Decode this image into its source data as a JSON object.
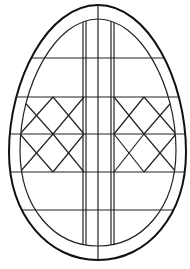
{
  "colors": {
    "background": "#ffffff",
    "line": "#222222"
  },
  "elements": {
    "outer_outline": "egg-outline",
    "inner_outline": "egg-inner-outline",
    "vertical_bands": [
      "left-double-stripe",
      "center-line",
      "right-double-stripe"
    ],
    "horizontal_bands": [
      "upper-band",
      "lattice-top",
      "lattice-middle",
      "lattice-bottom",
      "lower-band"
    ],
    "lattice_panels": [
      "left-lattice",
      "right-lattice"
    ]
  }
}
